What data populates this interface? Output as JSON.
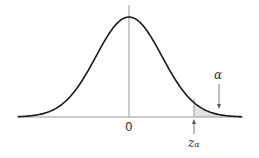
{
  "diagram": {
    "labels": {
      "origin": "0",
      "critical_value": "z",
      "critical_subscript": "α",
      "tail_area": "α"
    },
    "colors": {
      "curve": "#1a1a1a",
      "axis": "#999999",
      "shade": "#e3e3e3",
      "text": "#333333"
    }
  }
}
